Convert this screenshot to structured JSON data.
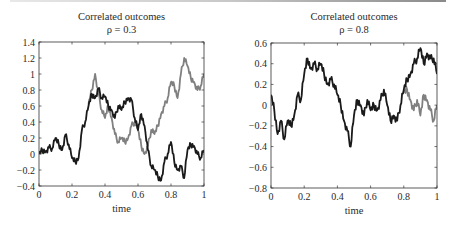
{
  "chart_data": [
    {
      "type": "line",
      "title": "Correlated outcomes",
      "subtitle": "ρ = 0.3",
      "xlabel": "time",
      "ylabel": "",
      "xlim": [
        0,
        1
      ],
      "ylim": [
        -0.4,
        1.4
      ],
      "xticks": [
        "0",
        "0.2",
        "0.4",
        "0.6",
        "0.8",
        "1"
      ],
      "yticks": [
        "1.4",
        "1.2",
        "1",
        "0.8",
        "0.6",
        "0.4",
        "0.2",
        "0",
        "-0.2",
        "-0.4"
      ],
      "grid": false,
      "legend": null,
      "series": [
        {
          "name": "outcome A",
          "color": "#1a1a1a",
          "x": [
            0,
            0.02,
            0.04,
            0.06,
            0.08,
            0.1,
            0.12,
            0.14,
            0.16,
            0.18,
            0.2,
            0.22,
            0.24,
            0.26,
            0.28,
            0.3,
            0.32,
            0.34,
            0.36,
            0.38,
            0.4,
            0.42,
            0.44,
            0.46,
            0.48,
            0.5,
            0.52,
            0.54,
            0.56,
            0.58,
            0.6,
            0.62,
            0.64,
            0.66,
            0.68,
            0.7,
            0.72,
            0.74,
            0.76,
            0.78,
            0.8,
            0.82,
            0.84,
            0.86,
            0.88,
            0.9,
            0.92,
            0.94,
            0.96,
            0.98,
            1.0
          ],
          "y": [
            0,
            0.05,
            0.03,
            0.08,
            0.07,
            0.2,
            0.12,
            0.05,
            0.24,
            0.12,
            -0.05,
            -0.1,
            -0.05,
            0.3,
            0.4,
            0.6,
            0.75,
            0.7,
            0.82,
            0.7,
            0.72,
            0.6,
            0.55,
            0.45,
            0.6,
            0.55,
            0.65,
            0.7,
            0.68,
            0.45,
            0.3,
            0.5,
            0.35,
            0.05,
            -0.15,
            -0.2,
            -0.28,
            -0.33,
            -0.1,
            0.0,
            0.15,
            -0.1,
            -0.2,
            -0.15,
            -0.3,
            0.05,
            0.12,
            0.1,
            0.0,
            -0.05,
            0.05
          ]
        },
        {
          "name": "outcome B",
          "color": "#808080",
          "x": [
            0.3,
            0.32,
            0.34,
            0.36,
            0.38,
            0.4,
            0.42,
            0.44,
            0.46,
            0.48,
            0.5,
            0.52,
            0.54,
            0.56,
            0.58,
            0.6,
            0.62,
            0.64,
            0.66,
            0.68,
            0.7,
            0.72,
            0.74,
            0.76,
            0.78,
            0.8,
            0.82,
            0.84,
            0.86,
            0.88,
            0.9,
            0.92,
            0.94,
            0.96,
            0.98,
            1.0
          ],
          "y": [
            0.62,
            0.8,
            1.0,
            0.75,
            0.55,
            0.45,
            0.6,
            0.45,
            0.25,
            0.15,
            0.2,
            0.15,
            0.2,
            0.35,
            0.4,
            0.3,
            0.1,
            0.0,
            0.1,
            0.3,
            0.25,
            0.35,
            0.5,
            0.6,
            0.7,
            0.9,
            0.85,
            0.7,
            1.0,
            1.2,
            1.1,
            0.95,
            0.9,
            0.8,
            0.85,
            1.0
          ]
        }
      ]
    },
    {
      "type": "line",
      "title": "Correlated outcomes",
      "subtitle": "ρ = 0.8",
      "xlabel": "time",
      "ylabel": "",
      "xlim": [
        0,
        1
      ],
      "ylim": [
        -0.8,
        0.6
      ],
      "xticks": [
        "0",
        "0.2",
        "0.4",
        "0.6",
        "0.8",
        "1"
      ],
      "yticks": [
        "0.6",
        "0.4",
        "0.2",
        "0",
        "-0.2",
        "-0.4",
        "-0.6",
        "-0.8"
      ],
      "grid": false,
      "legend": null,
      "series": [
        {
          "name": "outcome A",
          "color": "#1a1a1a",
          "x": [
            0,
            0.02,
            0.04,
            0.06,
            0.08,
            0.1,
            0.12,
            0.14,
            0.16,
            0.18,
            0.2,
            0.22,
            0.24,
            0.26,
            0.28,
            0.3,
            0.32,
            0.34,
            0.36,
            0.38,
            0.4,
            0.42,
            0.44,
            0.46,
            0.48,
            0.5,
            0.52,
            0.54,
            0.56,
            0.58,
            0.6,
            0.62,
            0.64,
            0.66,
            0.68,
            0.7,
            0.72,
            0.74,
            0.76,
            0.78,
            0.8,
            0.82,
            0.84,
            0.86,
            0.88,
            0.9,
            0.92,
            0.94,
            0.96,
            0.98,
            1.0
          ],
          "y": [
            0.1,
            -0.05,
            -0.28,
            -0.15,
            -0.33,
            -0.15,
            -0.2,
            -0.1,
            0.1,
            0.05,
            0.3,
            0.45,
            0.35,
            0.4,
            0.35,
            0.4,
            0.3,
            0.2,
            0.25,
            0.2,
            0.1,
            0.0,
            -0.15,
            -0.25,
            -0.4,
            -0.1,
            0.05,
            0.0,
            -0.1,
            0.05,
            -0.05,
            0.0,
            -0.05,
            0.05,
            0.15,
            0.0,
            -0.15,
            -0.1,
            -0.15,
            0.0,
            0.15,
            0.25,
            0.3,
            0.4,
            0.45,
            0.55,
            0.4,
            0.5,
            0.45,
            0.45,
            0.3
          ]
        },
        {
          "name": "outcome B",
          "color": "#808080",
          "x": [
            0.8,
            0.82,
            0.84,
            0.86,
            0.88,
            0.9,
            0.92,
            0.94,
            0.96,
            0.98,
            1.0
          ],
          "y": [
            0.12,
            0.15,
            0.05,
            -0.05,
            0.05,
            -0.1,
            0.1,
            0.05,
            -0.05,
            -0.15,
            0.0
          ]
        }
      ]
    }
  ]
}
